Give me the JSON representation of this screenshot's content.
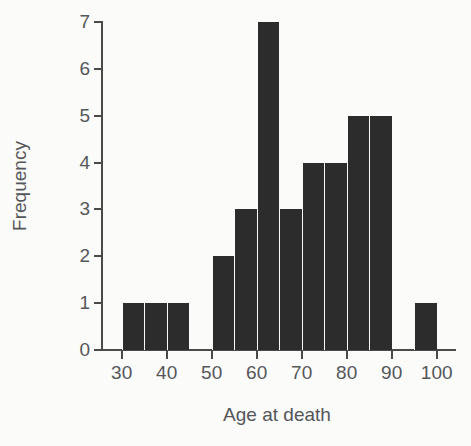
{
  "chart_data": {
    "type": "bar",
    "title": "",
    "subtitle": "",
    "xlabel": "Age at death",
    "ylabel": "Frequency",
    "xlim": [
      25,
      103
    ],
    "ylim": [
      0,
      7
    ],
    "grid": false,
    "legend": false,
    "bin_width": 5,
    "bin_edges": [
      30,
      35,
      40,
      45,
      50,
      55,
      60,
      65,
      70,
      75,
      80,
      85,
      90,
      95,
      100
    ],
    "categories": [
      "30-35",
      "35-40",
      "40-45",
      "45-50",
      "50-55",
      "55-60",
      "60-65",
      "65-70",
      "70-75",
      "75-80",
      "80-85",
      "85-90",
      "90-95",
      "95-100"
    ],
    "values": [
      1,
      1,
      1,
      0,
      2,
      3,
      7,
      3,
      4,
      4,
      5,
      5,
      0,
      1
    ],
    "bars": [
      {
        "bin_start": 30,
        "bin_end": 35,
        "value": 1
      },
      {
        "bin_start": 35,
        "bin_end": 40,
        "value": 1
      },
      {
        "bin_start": 40,
        "bin_end": 45,
        "value": 1
      },
      {
        "bin_start": 45,
        "bin_end": 50,
        "value": 0
      },
      {
        "bin_start": 50,
        "bin_end": 55,
        "value": 2
      },
      {
        "bin_start": 55,
        "bin_end": 60,
        "value": 3
      },
      {
        "bin_start": 60,
        "bin_end": 65,
        "value": 7
      },
      {
        "bin_start": 65,
        "bin_end": 70,
        "value": 3
      },
      {
        "bin_start": 70,
        "bin_end": 75,
        "value": 4
      },
      {
        "bin_start": 75,
        "bin_end": 80,
        "value": 4
      },
      {
        "bin_start": 80,
        "bin_end": 85,
        "value": 5
      },
      {
        "bin_start": 85,
        "bin_end": 90,
        "value": 5
      },
      {
        "bin_start": 90,
        "bin_end": 95,
        "value": 0
      },
      {
        "bin_start": 95,
        "bin_end": 100,
        "value": 1
      }
    ],
    "x_ticks": [
      30,
      40,
      50,
      60,
      70,
      80,
      90,
      100
    ],
    "x_tick_labels": [
      "30",
      "40",
      "50",
      "60",
      "70",
      "80",
      "90",
      "100"
    ],
    "y_ticks": [
      0,
      1,
      2,
      3,
      4,
      5,
      6,
      7
    ],
    "y_tick_labels": [
      "0",
      "1",
      "2",
      "3",
      "4",
      "5",
      "6",
      "7"
    ],
    "total_count": 38
  },
  "colors": {
    "bar": "#2c2c2c",
    "axis": "#4a4a48",
    "text": "#55565a",
    "background": "#fbfbf9"
  }
}
